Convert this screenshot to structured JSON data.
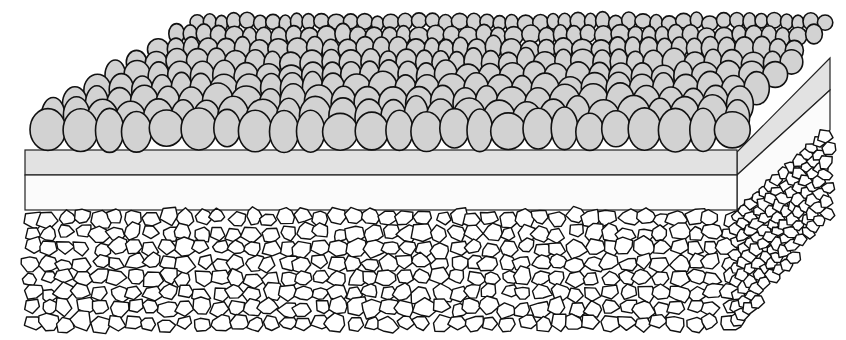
{
  "diagram": {
    "layers": [
      {
        "name": "pebble-surface",
        "fill": "#d2d2d2",
        "stroke": "#111111"
      },
      {
        "name": "gray-layer",
        "fill": "#e0e0e0",
        "stroke": "#222222"
      },
      {
        "name": "white-layer",
        "fill": "#fbfbfb",
        "stroke": "#222222"
      },
      {
        "name": "crushed-stone-base",
        "fill": "#ffffff",
        "stroke": "#111111"
      }
    ],
    "colors": {
      "background": "#ffffff",
      "pebble": "#d2d2d2",
      "gray_layer": "#e2e2e2",
      "white_layer": "#fbfbfb",
      "outline": "#111111"
    }
  }
}
